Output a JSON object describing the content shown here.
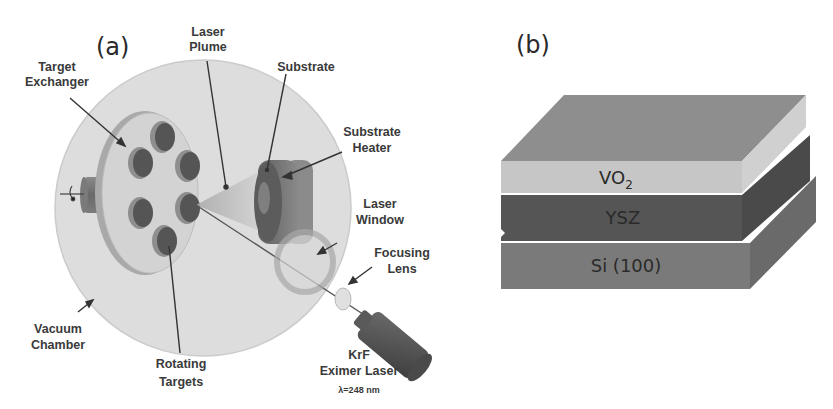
{
  "figure": {
    "panel_a": {
      "letter": "(a)",
      "title": "Pulsed laser deposition system schematic",
      "labels": {
        "laser_plume": [
          "Laser",
          "Plume"
        ],
        "target_exchanger": [
          "Target",
          "Exchanger"
        ],
        "substrate": [
          "Substrate"
        ],
        "substrate_heater": [
          "Substrate",
          "Heater"
        ],
        "laser_window": [
          "Laser",
          "Window"
        ],
        "focusing_lens": [
          "Focusing",
          "Lens"
        ],
        "vacuum_chamber": [
          "Vacuum",
          "Chamber"
        ],
        "rotating_targets": [
          "Rotating",
          "Targets"
        ],
        "laser_source": [
          "KrF",
          "Eximer Laser"
        ],
        "wavelength": "λ=248 nm"
      }
    },
    "panel_b": {
      "letter": "(b)",
      "title": "Thin film layer stack",
      "layers": [
        {
          "name": "VO",
          "subscript": "2",
          "color": "#c4c4c4",
          "top_color": "#8c8c8c"
        },
        {
          "name": "YSZ",
          "color": "#545454"
        },
        {
          "name": "Si (100)",
          "color": "#7a7a7a"
        }
      ]
    }
  },
  "colors": {
    "chamber": "#dcdcdc",
    "chamber_edge": "#c8c8c8",
    "exchanger_disk": "#cfcfcf",
    "target": "#555555",
    "target_rim": "#8a8a8a",
    "heater": "#5a5a5a",
    "text": "#3a3a3a"
  }
}
